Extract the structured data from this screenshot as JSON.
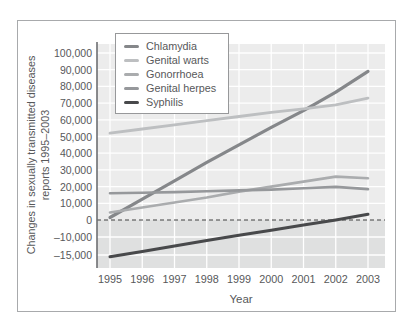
{
  "colors": {
    "background": "#ffffff",
    "frame": "#a8aaac",
    "plot_bg_above": "#ececec",
    "plot_bg_below": "#dfe0e0",
    "grid": "#ffffff",
    "zero_line": "#404041",
    "axis": "#6d6e71",
    "text": "#57585a",
    "legend_border": "#97989a"
  },
  "chart_data": {
    "type": "line",
    "title": "",
    "xlabel": "Year",
    "ylabel_lines": [
      "Changes in sexually transmitted diseases",
      "reports 1995–2003"
    ],
    "categories": [
      "1995",
      "1996",
      "1997",
      "1998",
      "1999",
      "2000",
      "2001",
      "2002",
      "2003"
    ],
    "series": [
      {
        "name": "Chlamydia",
        "color": "#85878a",
        "values": [
          1500,
          12500,
          23500,
          34500,
          45000,
          55500,
          65500,
          76500,
          89000
        ]
      },
      {
        "name": "Genital warts",
        "color": "#bdbfc1",
        "values": [
          52000,
          54500,
          57000,
          59500,
          62000,
          64500,
          66500,
          69000,
          73000
        ]
      },
      {
        "name": "Gonorrhoea",
        "color": "#aaacae",
        "values": [
          4500,
          7500,
          10500,
          13500,
          17000,
          20000,
          23000,
          26000,
          25000
        ]
      },
      {
        "name": "Genital herpes",
        "color": "#96989b",
        "values": [
          16000,
          16300,
          16700,
          17200,
          17700,
          18200,
          19000,
          19800,
          18500
        ]
      },
      {
        "name": "Syphilis",
        "color": "#48494b",
        "values": [
          -15500,
          -14000,
          -12500,
          -11000,
          -9000,
          -6000,
          -3000,
          0,
          3500
        ]
      }
    ],
    "y_ticks": [
      {
        "value": 100000,
        "label": "100,000"
      },
      {
        "value": 90000,
        "label": "90,000"
      },
      {
        "value": 80000,
        "label": "80,000"
      },
      {
        "value": 70000,
        "label": "70,000"
      },
      {
        "value": 60000,
        "label": "60,000"
      },
      {
        "value": 50000,
        "label": "50,000"
      },
      {
        "value": 40000,
        "label": "40,000"
      },
      {
        "value": 30000,
        "label": "30,000"
      },
      {
        "value": 20000,
        "label": "20,000"
      },
      {
        "value": 10000,
        "label": "10,000"
      },
      {
        "value": 0,
        "label": "0"
      },
      {
        "value": -10000,
        "label": "–10,000"
      },
      {
        "value": -15000,
        "label": "–15,000"
      }
    ],
    "ylim": [
      -15000,
      100000
    ],
    "grid": true,
    "legend_position": "top-left",
    "zero_line": "dashed",
    "y_scale_note": "axis spacing compressed/stretched below -10,000 as printed"
  }
}
